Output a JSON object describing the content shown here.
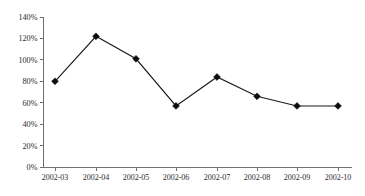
{
  "chart_data": {
    "type": "line",
    "title": "",
    "subtitle": "",
    "xlabel": "",
    "ylabel": "",
    "categories": [
      "2002-03",
      "2002-04",
      "2002-05",
      "2002-06",
      "2002-07",
      "2002-08",
      "2002-09",
      "2002-10"
    ],
    "values": [
      80,
      122,
      101,
      57,
      84,
      66,
      57,
      57
    ],
    "value_labels": [
      "80%",
      "122%",
      "101%",
      "57%",
      "84%",
      "66%",
      "57%",
      "57%"
    ],
    "series": [
      {
        "name": "",
        "values": [
          80,
          122,
          101,
          57,
          84,
          66,
          57,
          57
        ],
        "color": "#0d0d0d",
        "marker": "diamond"
      }
    ],
    "ylim": [
      0,
      140
    ],
    "ytick_values": [
      0,
      20,
      40,
      60,
      80,
      100,
      120,
      140
    ],
    "ytick_labels": [
      "0%",
      "20%",
      "40%",
      "60%",
      "80%",
      "100%",
      "120%",
      "140%"
    ],
    "xtick_labels": [
      "2002-03",
      "2002-04",
      "2002-05",
      "2002-06",
      "2002-07",
      "2002-08",
      "2002-09",
      "2002-10"
    ],
    "grid": false,
    "legend": false,
    "legend_position": "none",
    "annotations": [],
    "axis_color": "#6f6f6f",
    "line_color": "#1a1a1a",
    "background_color": "#ffffff"
  }
}
